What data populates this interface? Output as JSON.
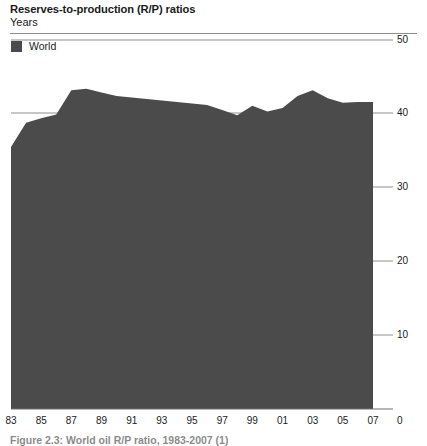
{
  "header": {
    "title": "Reserves-to-production (R/P) ratios",
    "subtitle": "Years"
  },
  "legend": {
    "items": [
      {
        "label": "World",
        "color": "#4b4b4b",
        "swatch_icon": "filled-square-icon"
      }
    ]
  },
  "footer": {
    "caption": "Figure 2.3: World oil R/P ratio, 1983-2007 (1)"
  },
  "axes": {
    "y_label_position": "right",
    "y_ticks": [
      "50",
      "40",
      "30",
      "20",
      "10",
      "0"
    ],
    "x_ticks": [
      "83",
      "85",
      "87",
      "89",
      "91",
      "93",
      "95",
      "97",
      "99",
      "01",
      "03",
      "05",
      "07"
    ],
    "y_zero_label": "0"
  },
  "chart_data": {
    "type": "area",
    "title": "Reserves-to-production (R/P) ratios",
    "subtitle": "Years",
    "xlabel": "",
    "ylabel": "Years",
    "ylim": [
      0,
      50
    ],
    "ytick_values": [
      0,
      10,
      20,
      30,
      40,
      50
    ],
    "grid": true,
    "grid_axis": "y",
    "legend_position": "top-left",
    "fill_color": "#4b4b4b",
    "x": [
      1983,
      1984,
      1985,
      1986,
      1987,
      1988,
      1989,
      1990,
      1991,
      1992,
      1993,
      1994,
      1995,
      1996,
      1997,
      1998,
      1999,
      2000,
      2001,
      2002,
      2003,
      2004,
      2005,
      2006,
      2007
    ],
    "categories": [
      "83",
      "84",
      "85",
      "86",
      "87",
      "88",
      "89",
      "90",
      "91",
      "92",
      "93",
      "94",
      "95",
      "96",
      "97",
      "98",
      "99",
      "00",
      "01",
      "02",
      "03",
      "04",
      "05",
      "06",
      "07"
    ],
    "series": [
      {
        "name": "World",
        "color": "#4b4b4b",
        "values": [
          35.5,
          38.8,
          39.4,
          39.9,
          43.2,
          43.4,
          42.9,
          42.4,
          42.2,
          42.0,
          41.8,
          41.6,
          41.4,
          41.2,
          40.5,
          39.8,
          41.1,
          40.3,
          40.8,
          42.4,
          43.2,
          42.1,
          41.5,
          41.6,
          41.6
        ]
      }
    ]
  }
}
